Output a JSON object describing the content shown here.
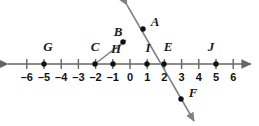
{
  "figure": {
    "colors": {
      "axis": "#666666",
      "line": "#808080",
      "point": "#111111",
      "text": "#1a1a1a",
      "background": "#ffffff"
    },
    "axis": {
      "y": 64,
      "x_start": 8,
      "x_end": 251,
      "zero_x": 130,
      "unit_px": 17.2,
      "tick_half_height": 5,
      "ticks": [
        -6,
        -5,
        -4,
        -3,
        -2,
        -1,
        0,
        1,
        2,
        3,
        4,
        5,
        6
      ],
      "tick_labels": [
        "–6",
        "–5",
        "–4",
        "–3",
        "–2",
        "–1",
        "0",
        "1",
        "2",
        "3",
        "4",
        "5",
        "6"
      ],
      "label_y": 77,
      "left_arrow": true,
      "right_arrow": true
    },
    "axis_points": [
      {
        "name": "G",
        "value": -5,
        "x": 44,
        "y": 64,
        "label": "G",
        "label_x": 48,
        "label_y": 46
      },
      {
        "name": "C",
        "value": -2,
        "x": 95,
        "y": 64,
        "label": "C",
        "label_x": 95,
        "label_y": 46
      },
      {
        "name": "H",
        "value": -1,
        "x": 113,
        "y": 64,
        "label": "H",
        "label_x": 116,
        "label_y": 48
      },
      {
        "name": "I",
        "value": 1,
        "x": 147,
        "y": 64,
        "label": "I",
        "label_x": 148,
        "label_y": 47
      },
      {
        "name": "E",
        "value": 2,
        "x": 164,
        "y": 64,
        "label": "E",
        "label_x": 168,
        "label_y": 46
      },
      {
        "name": "J",
        "value": 5,
        "x": 216,
        "y": 64,
        "label": "J",
        "label_x": 211,
        "label_y": 46
      }
    ],
    "free_points": [
      {
        "name": "A",
        "x": 143,
        "y": 29,
        "label": "A",
        "label_x": 155,
        "label_y": 21
      },
      {
        "name": "B",
        "x": 123,
        "y": 42,
        "label": "B",
        "label_x": 118,
        "label_y": 31
      },
      {
        "name": "F",
        "x": 181,
        "y": 99,
        "label": "F",
        "label_x": 193,
        "label_y": 92
      }
    ],
    "slanted_line": {
      "name": "line-through-A-E-F",
      "from_x": 127,
      "from_y": 5,
      "to_x": 194,
      "to_y": 121,
      "arrow_start": true,
      "arrow_end": true,
      "passes_through": [
        "A",
        "E",
        "F"
      ]
    },
    "segment_CB": {
      "name": "segment-C-to-B",
      "from_x": 95,
      "from_y": 64,
      "to_x": 126,
      "to_y": 40
    }
  }
}
